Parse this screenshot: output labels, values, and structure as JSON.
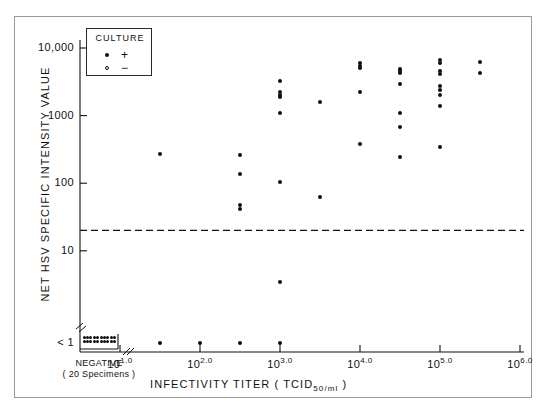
{
  "chart_data": {
    "type": "scatter",
    "title": "",
    "xlabel": "INFECTIVITY TITER (TCID50/ml)",
    "ylabel": "NET HSV SPECIFIC INTENSITY VALUE",
    "xlabel_main": "INFECTIVITY  TITER  ( TCID",
    "xlabel_sub": "50/ml",
    "xlabel_tail": " )",
    "xscale": "log",
    "yscale": "log",
    "xlim_exponents": [
      1.0,
      6.0
    ],
    "ylim": [
      1,
      10000
    ],
    "grid": false,
    "xticks": [
      {
        "label_base": "10",
        "label_exp": "1.0",
        "value": 1.0
      },
      {
        "label_base": "10",
        "label_exp": "2.0",
        "value": 2.0
      },
      {
        "label_base": "10",
        "label_exp": "3.0",
        "value": 3.0
      },
      {
        "label_base": "10",
        "label_exp": "4.0",
        "value": 4.0
      },
      {
        "label_base": "10",
        "label_exp": "5.0",
        "value": 5.0
      },
      {
        "label_base": "10",
        "label_exp": "6.0",
        "value": 6.0
      }
    ],
    "yticks": [
      {
        "label": "10,000",
        "value": 10000
      },
      {
        "label": "1000",
        "value": 1000
      },
      {
        "label": "100",
        "value": 100
      },
      {
        "label": "10",
        "value": 10
      },
      {
        "label": "< 1",
        "value": 1
      }
    ],
    "axis_break": {
      "x_axis": true,
      "y_axis": true
    },
    "legend": {
      "position": "top-left-inside",
      "title": "CULTURE",
      "entries": [
        {
          "marker": "filled-circle",
          "symbol": "+",
          "name": "culture positive"
        },
        {
          "marker": "open-circle",
          "symbol": "−",
          "name": "culture negative"
        }
      ]
    },
    "threshold_line": {
      "value": 20,
      "style": "dashed",
      "orientation": "horizontal",
      "label": ""
    },
    "negative_group": {
      "axis_label": "NEGATIVE",
      "axis_sublabel": "( 20 Specimens )",
      "count": 20,
      "y_value": "< 1",
      "marker": "filled-circle",
      "rows": 2,
      "cols": 10
    },
    "series": [
      {
        "name": "culture positive",
        "marker": "filled-circle",
        "points": [
          {
            "x_exp": 1.5,
            "y": 270
          },
          {
            "x_exp": 1.5,
            "y": 1
          },
          {
            "x_exp": 2.0,
            "y": 1
          },
          {
            "x_exp": 2.5,
            "y": 260
          },
          {
            "x_exp": 2.5,
            "y": 135
          },
          {
            "x_exp": 2.5,
            "y": 47
          },
          {
            "x_exp": 2.5,
            "y": 42
          },
          {
            "x_exp": 2.5,
            "y": 1
          },
          {
            "x_exp": 3.0,
            "y": 3300
          },
          {
            "x_exp": 3.0,
            "y": 2200
          },
          {
            "x_exp": 3.0,
            "y": 2000
          },
          {
            "x_exp": 3.0,
            "y": 1900
          },
          {
            "x_exp": 3.0,
            "y": 1080
          },
          {
            "x_exp": 3.0,
            "y": 105
          },
          {
            "x_exp": 3.0,
            "y": 3.5
          },
          {
            "x_exp": 3.0,
            "y": 1
          },
          {
            "x_exp": 3.5,
            "y": 1600
          },
          {
            "x_exp": 3.5,
            "y": 63
          },
          {
            "x_exp": 4.0,
            "y": 5900
          },
          {
            "x_exp": 4.0,
            "y": 5500
          },
          {
            "x_exp": 4.0,
            "y": 5100
          },
          {
            "x_exp": 4.0,
            "y": 2200
          },
          {
            "x_exp": 4.0,
            "y": 380
          },
          {
            "x_exp": 4.5,
            "y": 4900
          },
          {
            "x_exp": 4.5,
            "y": 4500
          },
          {
            "x_exp": 4.5,
            "y": 4200
          },
          {
            "x_exp": 4.5,
            "y": 2900
          },
          {
            "x_exp": 4.5,
            "y": 1100
          },
          {
            "x_exp": 4.5,
            "y": 680
          },
          {
            "x_exp": 4.5,
            "y": 240
          },
          {
            "x_exp": 5.0,
            "y": 6700
          },
          {
            "x_exp": 5.0,
            "y": 6100
          },
          {
            "x_exp": 5.0,
            "y": 4600
          },
          {
            "x_exp": 5.0,
            "y": 4100
          },
          {
            "x_exp": 5.0,
            "y": 2700
          },
          {
            "x_exp": 5.0,
            "y": 2400
          },
          {
            "x_exp": 5.0,
            "y": 2000
          },
          {
            "x_exp": 5.0,
            "y": 1400
          },
          {
            "x_exp": 5.0,
            "y": 340
          },
          {
            "x_exp": 5.5,
            "y": 6200
          },
          {
            "x_exp": 5.5,
            "y": 4300
          }
        ]
      },
      {
        "name": "culture negative",
        "marker": "open-circle",
        "points": []
      }
    ]
  }
}
